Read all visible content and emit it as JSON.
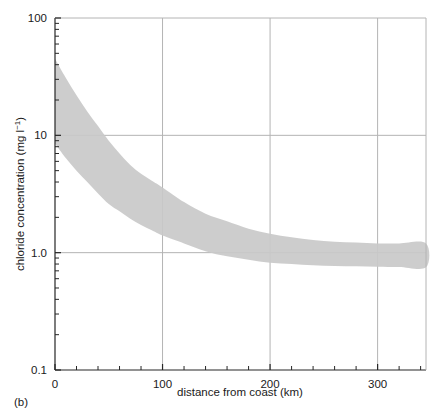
{
  "panel": {
    "label": "(b)"
  },
  "chart_data": {
    "type": "area",
    "title": "",
    "subtitle": "",
    "xlabel": "distance from coast (km)",
    "ylabel": "chloride concentration (mg l",
    "ylabel_superscript": "−1",
    "ylabel_suffix": ")",
    "ylabel_full": "chloride concentration (mg l⁻¹)",
    "xscale": "linear",
    "yscale": "log",
    "xlim": [
      0,
      345
    ],
    "ylim": [
      0.1,
      100
    ],
    "grid": true,
    "grid_color": "#b4b4b4",
    "legend": "none",
    "band_color": "#c9c9c9",
    "axis_color": "#262626",
    "xticks": [
      0,
      100,
      200,
      300
    ],
    "xtick_labels": [
      "0",
      "100",
      "200",
      "300"
    ],
    "xminor_tick_step": 20,
    "yticks": [
      0.1,
      1.0,
      10,
      100
    ],
    "ytick_labels": [
      "0.1",
      "1.0",
      "10",
      "100"
    ],
    "yminor_ticks_per_decade": [
      2,
      3,
      4,
      5,
      6,
      7,
      8,
      9
    ],
    "series": [
      {
        "name": "upper bound",
        "x": [
          0,
          10,
          20,
          30,
          40,
          50,
          60,
          70,
          80,
          90,
          100,
          120,
          140,
          160,
          180,
          200,
          220,
          240,
          260,
          280,
          300,
          320,
          345
        ],
        "values": [
          45,
          31,
          22,
          16,
          12,
          9.0,
          7.0,
          5.6,
          4.7,
          4.1,
          3.6,
          2.7,
          2.15,
          1.85,
          1.6,
          1.45,
          1.35,
          1.28,
          1.24,
          1.22,
          1.2,
          1.2,
          1.2
        ]
      },
      {
        "name": "lower bound",
        "x": [
          0,
          10,
          20,
          30,
          40,
          50,
          60,
          70,
          80,
          90,
          100,
          120,
          140,
          160,
          180,
          200,
          220,
          240,
          260,
          280,
          300,
          320,
          345
        ],
        "values": [
          8.5,
          6.4,
          5.0,
          4.0,
          3.2,
          2.6,
          2.25,
          1.95,
          1.72,
          1.55,
          1.4,
          1.2,
          1.03,
          0.93,
          0.87,
          0.82,
          0.8,
          0.78,
          0.77,
          0.765,
          0.76,
          0.755,
          0.75
        ]
      }
    ],
    "annotations": []
  }
}
